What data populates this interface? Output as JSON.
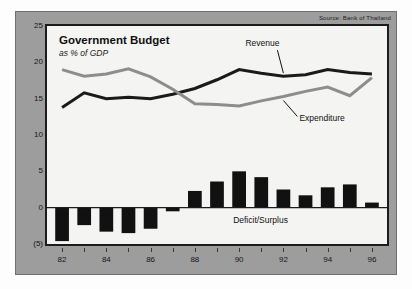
{
  "source": {
    "label": "Source: Bank of Thailand"
  },
  "chart_data": {
    "type": "bar",
    "title": "Government Budget",
    "subtitle": "as % of GDP",
    "xlabel": "",
    "ylabel": "",
    "ylim": [
      -5,
      25
    ],
    "yticks": [
      25,
      20,
      15,
      10,
      5,
      0,
      -5
    ],
    "ytick_labels": [
      "25",
      "20",
      "15",
      "10",
      "5",
      "0",
      "(5)"
    ],
    "grid": false,
    "legend_position": "inline-annotations",
    "categories": [
      1982,
      1983,
      1984,
      1985,
      1986,
      1987,
      1988,
      1989,
      1990,
      1991,
      1992,
      1993,
      1994,
      1995,
      1996
    ],
    "xtick_labels": [
      "82",
      "84",
      "86",
      "88",
      "90",
      "92",
      "94",
      "96"
    ],
    "xtick_years": [
      1982,
      1984,
      1986,
      1988,
      1990,
      1992,
      1994,
      1996
    ],
    "series": [
      {
        "name": "Deficit/Surplus",
        "type": "bar",
        "color": "#111111",
        "values": [
          -4.6,
          -2.4,
          -3.3,
          -3.5,
          -2.9,
          -0.5,
          2.3,
          3.6,
          5.0,
          4.2,
          2.5,
          1.7,
          2.8,
          3.2,
          0.7
        ]
      },
      {
        "name": "Revenue",
        "type": "line",
        "color": "#1a1a1a",
        "values": [
          13.8,
          15.8,
          15.0,
          15.2,
          15.0,
          15.6,
          16.4,
          17.6,
          19.0,
          18.5,
          18.1,
          18.3,
          19.0,
          18.6,
          18.4
        ]
      },
      {
        "name": "Expenditure",
        "type": "line",
        "color": "#8d8d8d",
        "values": [
          19.0,
          18.1,
          18.4,
          19.1,
          18.0,
          16.3,
          14.3,
          14.2,
          14.0,
          14.7,
          15.3,
          16.0,
          16.6,
          15.4,
          17.9
        ]
      }
    ],
    "annotations": [
      {
        "text": "Revenue",
        "series": "Revenue"
      },
      {
        "text": "Expenditure",
        "series": "Expenditure"
      },
      {
        "text": "Deficit/Surplus",
        "series": "Deficit/Surplus"
      }
    ],
    "colors": {
      "revenue": "#1a1a1a",
      "expenditure": "#8d8d8d",
      "bars": "#111111",
      "panel": "#9d9d9d",
      "plot_background": "#f4f4f2",
      "axis": "#1c1c1c"
    }
  }
}
